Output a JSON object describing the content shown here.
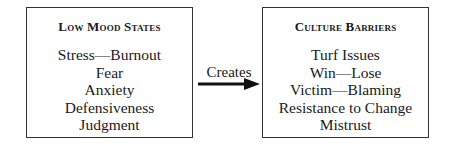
{
  "diagram": {
    "left_box": {
      "title": "Low Mood States",
      "items": [
        "Stress—Burnout",
        "Fear",
        "Anxiety",
        "Defensiveness",
        "Judgment"
      ]
    },
    "connector": {
      "label": "Creates",
      "direction": "left-to-right",
      "icon": "right-arrow-icon"
    },
    "right_box": {
      "title": "Culture Barriers",
      "items": [
        "Turf Issues",
        "Win—Lose",
        "Victim—Blaming",
        "Resistance to Change",
        "Mistrust"
      ]
    }
  }
}
